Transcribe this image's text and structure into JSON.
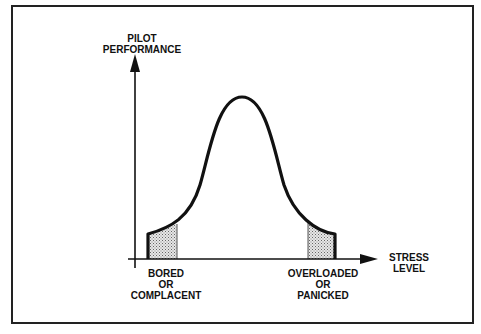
{
  "diagram": {
    "type": "bell-curve",
    "y_axis_label": "PILOT\nPERFORMANCE",
    "x_axis_label": "STRESS\nLEVEL",
    "low_region_label": "BORED\nOR\nCOMPLACENT",
    "high_region_label": "OVERLOADED\nOR\nPANICKED",
    "colors": {
      "line": "#111111",
      "shade": "#bbbbbb",
      "background": "#ffffff",
      "frame": "#222222"
    }
  }
}
